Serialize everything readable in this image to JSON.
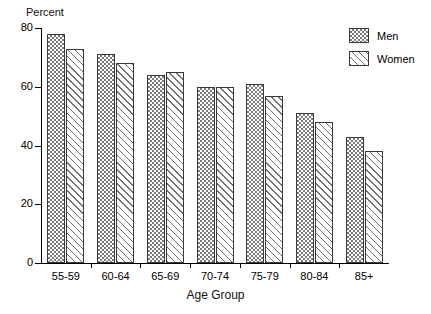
{
  "chart_data": {
    "type": "bar",
    "title": "",
    "xlabel": "Age Group",
    "ylabel": "Percent",
    "categories": [
      "55-59",
      "60-64",
      "65-69",
      "70-74",
      "75-79",
      "80-84",
      "85+"
    ],
    "series": [
      {
        "name": "Men",
        "values": [
          78,
          71,
          64,
          60,
          61,
          51,
          43
        ]
      },
      {
        "name": "Women",
        "values": [
          73,
          68,
          65,
          60,
          57,
          48,
          38
        ]
      }
    ],
    "ylim": [
      0,
      80
    ],
    "yticks": [
      0,
      20,
      40,
      60,
      80
    ],
    "ytick_labels": [
      "0",
      "20",
      "40",
      "60",
      "80"
    ],
    "grid": false,
    "legend_position": "top-right",
    "legend_entries": [
      {
        "label": "Men",
        "pattern": "checkerboard-hatch"
      },
      {
        "label": "Women",
        "pattern": "diagonal-hatch"
      }
    ]
  }
}
